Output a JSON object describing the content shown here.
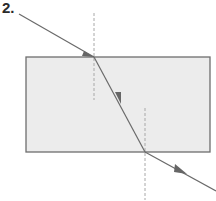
{
  "figure": {
    "number_label": "2.",
    "colors": {
      "block_fill": "#ececec",
      "block_stroke": "#6e6e6e",
      "ray": "#6a6a6a",
      "normal": "#a8a8a8"
    }
  }
}
